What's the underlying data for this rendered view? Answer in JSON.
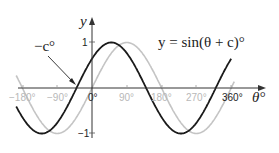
{
  "chart_data": {
    "type": "line",
    "title": "",
    "equation_label": "y = sin(θ + c)°",
    "xlabel": "θ°",
    "ylabel": "y",
    "x_ticks": [
      "−180°",
      "−90°",
      "0°",
      "90°",
      "180°",
      "270°",
      "360°"
    ],
    "x_tick_values": [
      -180,
      -90,
      0,
      90,
      180,
      270,
      360
    ],
    "y_ticks": [
      "1",
      "−1"
    ],
    "y_tick_values": [
      1,
      -1
    ],
    "xlim": [
      -190,
      370
    ],
    "ylim": [
      -1,
      1
    ],
    "annotation": {
      "text": "−c°",
      "points_to_x": -40
    },
    "c_estimate": 40,
    "series": [
      {
        "name": "y = sin(θ + c)°",
        "color": "#1a1a1a",
        "shift": 40,
        "x": [
          -180,
          -130,
          -90,
          -40,
          0,
          50,
          90,
          140,
          180,
          230,
          270,
          320,
          360
        ],
        "values": [
          -0.64,
          -1.0,
          -0.77,
          0.0,
          0.64,
          1.0,
          0.77,
          0.0,
          -0.64,
          -1.0,
          -0.77,
          0.0,
          0.64
        ]
      },
      {
        "name": "y = sin θ°",
        "color": "#c0c0c0",
        "shift": 0,
        "x": [
          -180,
          -90,
          0,
          90,
          180,
          270,
          360
        ],
        "values": [
          0,
          -1,
          0,
          1,
          0,
          -1,
          0
        ]
      }
    ],
    "grid": false,
    "legend": "none"
  },
  "labels": {
    "y_axis": "y",
    "x_axis": "θ°",
    "equation": "y = sin(θ + c)°",
    "annotation": "−c°",
    "tick_1": "1",
    "tick_neg1": "−1",
    "xt0": "−180°",
    "xt1": "−90°",
    "xt2": "0°",
    "xt3": "90°",
    "xt4": "180°",
    "xt5": "270°",
    "xt6": "360°"
  }
}
